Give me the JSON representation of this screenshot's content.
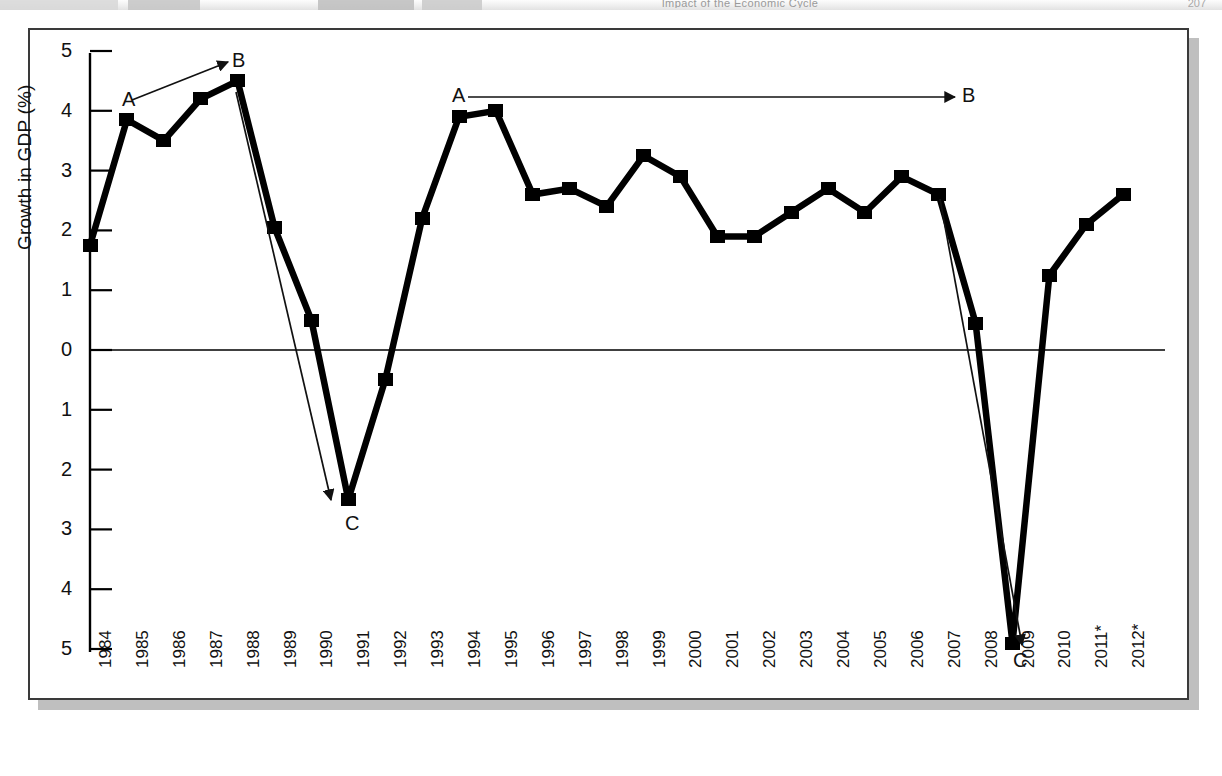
{
  "page": {
    "running_head": "Impact of the Economic Cycle",
    "folio": "207"
  },
  "figure": {
    "y_axis_title": "Growth in GDP (%)",
    "y_tick_labels": [
      "5",
      "4",
      "3",
      "2",
      "1",
      "0",
      "1",
      "2",
      "3",
      "4",
      "5"
    ],
    "annotations": [
      {
        "label": "A",
        "x": 122,
        "y": 89
      },
      {
        "label": "B",
        "x": 232,
        "y": 50
      },
      {
        "label": "C",
        "x": 345,
        "y": 513
      },
      {
        "label": "A",
        "x": 452,
        "y": 85
      },
      {
        "label": "B",
        "x": 962,
        "y": 85
      },
      {
        "label": "C",
        "x": 1013,
        "y": 650
      }
    ],
    "arrows": [
      {
        "name": "arrow-a-b-cycle1",
        "x1": 132,
        "y1": 100,
        "x2": 228,
        "y2": 62
      },
      {
        "name": "arrow-b-c-cycle1",
        "x1": 236,
        "y1": 92,
        "x2": 331,
        "y2": 500
      },
      {
        "name": "arrow-a-b-cycle2",
        "x1": 468,
        "y1": 97,
        "x2": 955,
        "y2": 97
      },
      {
        "name": "arrow-b-c-cycle2",
        "x1": 940,
        "y1": 199,
        "x2": 1022,
        "y2": 645
      }
    ],
    "colors": {
      "series_line": "#000000",
      "axis": "#000000",
      "frame": "#3a3a3a",
      "shadow": "#a9a9a9",
      "background": "#ffffff"
    }
  },
  "chart_data": {
    "type": "line",
    "title": "",
    "xlabel": "",
    "ylabel": "Growth in GDP (%)",
    "ylim": [
      -5,
      5
    ],
    "ytick_values": [
      5,
      4,
      3,
      2,
      1,
      0,
      -1,
      -2,
      -3,
      -4,
      -5
    ],
    "grid": false,
    "legend": "none",
    "zero_line": true,
    "note": "Negative y-axis tick labels are printed without minus signs; years marked * are forecasts.",
    "categories": [
      "1984",
      "1985",
      "1986",
      "1987",
      "1988",
      "1989",
      "1990",
      "1991",
      "1992",
      "1993",
      "1994",
      "1995",
      "1996",
      "1997",
      "1998",
      "1999",
      "2000",
      "2001",
      "2002",
      "2003",
      "2004",
      "2005",
      "2006",
      "2007",
      "2008",
      "2009",
      "2010",
      "2011*",
      "2012*"
    ],
    "values": [
      1.75,
      3.85,
      3.5,
      4.2,
      4.5,
      2.05,
      0.5,
      -2.5,
      -0.5,
      2.2,
      3.9,
      4.0,
      2.6,
      2.7,
      2.4,
      3.25,
      2.9,
      1.9,
      1.9,
      2.3,
      2.7,
      2.3,
      2.9,
      2.6,
      0.45,
      -4.9,
      1.25,
      2.1,
      2.6
    ],
    "series": [
      {
        "name": "Growth in GDP (%)",
        "values": [
          1.75,
          3.85,
          3.5,
          4.2,
          4.5,
          2.05,
          0.5,
          -2.5,
          -0.5,
          2.2,
          3.9,
          4.0,
          2.6,
          2.7,
          2.4,
          3.25,
          2.9,
          1.9,
          1.9,
          2.3,
          2.7,
          2.3,
          2.9,
          2.6,
          0.45,
          -4.9,
          1.25,
          2.1,
          2.6
        ]
      }
    ],
    "annotation_points": [
      {
        "label": "A",
        "category": "1985",
        "meaning": "cycle-start"
      },
      {
        "label": "B",
        "category": "1988",
        "meaning": "cycle-peak"
      },
      {
        "label": "C",
        "category": "1991",
        "meaning": "cycle-trough"
      },
      {
        "label": "A",
        "category": "1994",
        "meaning": "cycle-start"
      },
      {
        "label": "B",
        "category": "2007",
        "meaning": "cycle-peak"
      },
      {
        "label": "C",
        "category": "2009",
        "meaning": "cycle-trough"
      }
    ]
  }
}
